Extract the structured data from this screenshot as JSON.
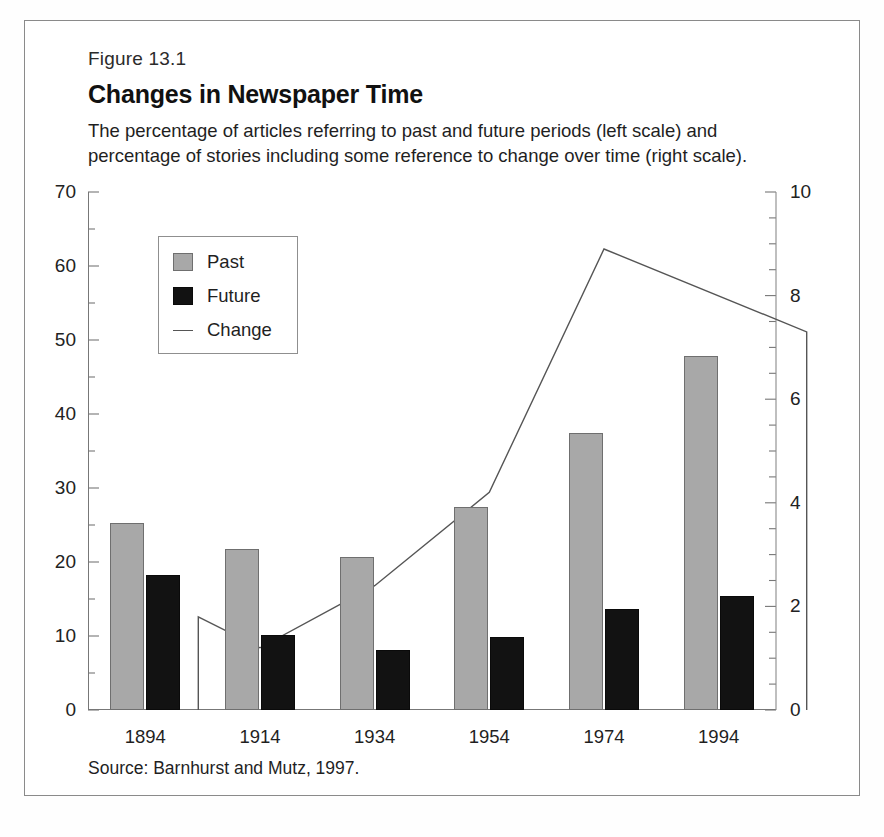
{
  "figure": {
    "number_label": "Figure 13.1",
    "title": "Changes in Newspaper Time",
    "subtitle": "The percentage of articles referring to past and future periods (left scale) and percentage of stories including some reference to change over time (right scale).",
    "source": "Source: Barnhurst and Mutz, 1997."
  },
  "legend": {
    "items": [
      {
        "label": "Past",
        "marker": "gray-square",
        "color": "#a8a8a8"
      },
      {
        "label": "Future",
        "marker": "black-square",
        "color": "#121212"
      },
      {
        "label": "Change",
        "marker": "line",
        "color": "#555555"
      }
    ]
  },
  "chart_data": {
    "type": "bar",
    "title": "Changes in Newspaper Time",
    "subtitle": "The percentage of articles referring to past and future periods (left scale) and percentage of stories including some reference to change over time (right scale).",
    "xlabel": "",
    "ylabel": "",
    "categories": [
      "1894",
      "1914",
      "1934",
      "1954",
      "1974",
      "1994"
    ],
    "series": [
      {
        "name": "Past",
        "type": "bar",
        "axis": "left",
        "color": "#a8a8a8",
        "values": [
          25.3,
          21.8,
          20.7,
          27.4,
          37.4,
          47.8
        ]
      },
      {
        "name": "Future",
        "type": "bar",
        "axis": "left",
        "color": "#121212",
        "values": [
          18.3,
          10.2,
          8.1,
          9.8,
          13.6,
          15.4
        ]
      },
      {
        "name": "Change",
        "type": "line",
        "axis": "right",
        "color": "#555555",
        "values": [
          1.8,
          1.2,
          2.4,
          4.2,
          8.9,
          7.3
        ]
      }
    ],
    "left_axis": {
      "min": 0,
      "max": 70,
      "ticks": [
        0,
        10,
        20,
        30,
        40,
        50,
        60,
        70
      ],
      "minor_step": 5
    },
    "right_axis": {
      "min": 0,
      "max": 10,
      "ticks": [
        0,
        2,
        4,
        6,
        8,
        10
      ],
      "minor_step": 0.5
    },
    "grid": false,
    "legend_position": "inside-top-left"
  }
}
